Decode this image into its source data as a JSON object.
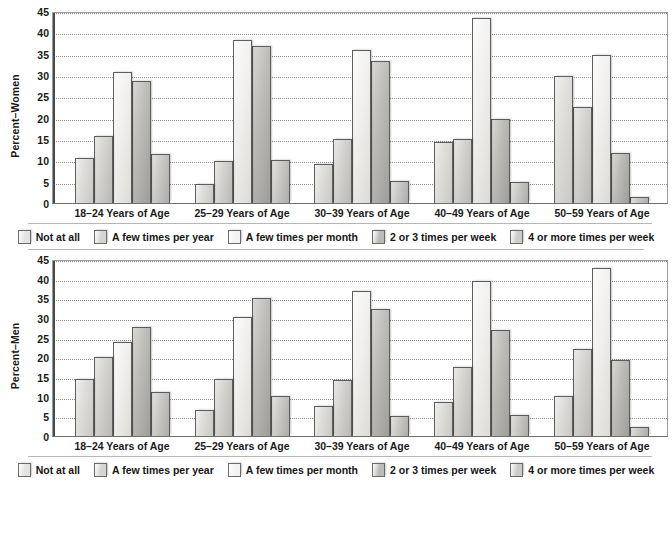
{
  "chart_data": [
    {
      "type": "bar",
      "title": "",
      "xlabel": "",
      "ylabel": "Percent–Women",
      "ylim": [
        0,
        45
      ],
      "yticks": [
        0,
        5,
        10,
        15,
        20,
        25,
        30,
        35,
        40,
        45
      ],
      "grid": true,
      "legend_position": "bottom",
      "categories": [
        "18–24 Years of Age",
        "25–29 Years of Age",
        "30–39 Years of Age",
        "40–49 Years of Age",
        "50–59 Years of Age"
      ],
      "series": [
        {
          "name": "Not at all",
          "values": [
            10.6,
            4.5,
            9.2,
            14.3,
            29.7
          ]
        },
        {
          "name": "A few times per year",
          "values": [
            15.7,
            9.9,
            15.1,
            15.0,
            22.5
          ]
        },
        {
          "name": "A few times per month",
          "values": [
            30.8,
            38.1,
            35.8,
            43.3,
            34.7
          ]
        },
        {
          "name": "2 or 3 times per week",
          "values": [
            28.7,
            36.7,
            33.2,
            19.6,
            11.7
          ]
        },
        {
          "name": "4 or more times per week",
          "values": [
            11.4,
            10.0,
            5.1,
            5.0,
            1.3
          ]
        }
      ]
    },
    {
      "type": "bar",
      "title": "",
      "xlabel": "",
      "ylabel": "Percent–Men",
      "ylim": [
        0,
        45
      ],
      "yticks": [
        0,
        5,
        10,
        15,
        20,
        25,
        30,
        35,
        40,
        45
      ],
      "grid": true,
      "legend_position": "bottom",
      "categories": [
        "18–24 Years of Age",
        "25–29 Years of Age",
        "30–39 Years of Age",
        "40–49 Years of Age",
        "50–59 Years of Age"
      ],
      "series": [
        {
          "name": "Not at all",
          "values": [
            14.5,
            6.7,
            7.6,
            8.7,
            10.2
          ]
        },
        {
          "name": "A few times per year",
          "values": [
            20.1,
            14.5,
            14.3,
            17.6,
            22.2
          ]
        },
        {
          "name": "A few times per month",
          "values": [
            24.0,
            30.2,
            36.8,
            39.5,
            42.8
          ]
        },
        {
          "name": "2 or 3 times per week",
          "values": [
            27.6,
            35.2,
            32.2,
            27.0,
            19.4
          ]
        },
        {
          "name": "4 or more times per week",
          "values": [
            11.2,
            10.1,
            5.2,
            5.3,
            2.4
          ]
        }
      ]
    }
  ],
  "panels": [
    {
      "id": "women",
      "ylabel": "Percent–Women",
      "yticks": [
        "45",
        "40",
        "35",
        "30",
        "25",
        "20",
        "15",
        "10",
        "5",
        "0"
      ],
      "categories": [
        "18–24 Years of Age",
        "25–29 Years of Age",
        "30–39 Years of Age",
        "40–49 Years of Age",
        "50–59 Years of Age"
      ]
    },
    {
      "id": "men",
      "ylabel": "Percent–Men",
      "yticks": [
        "45",
        "40",
        "35",
        "30",
        "25",
        "20",
        "15",
        "10",
        "5",
        "0"
      ],
      "categories": [
        "18–24 Years of Age",
        "25–29 Years of Age",
        "30–39 Years of Age",
        "40–49 Years of Age",
        "50–59 Years of Age"
      ]
    }
  ],
  "legend": {
    "items": [
      {
        "label": "Not at all",
        "color": "#e4e3e0"
      },
      {
        "label": "A few times per year",
        "color": "#d6d5d1"
      },
      {
        "label": "A few times per month",
        "color": "#f4f3f1"
      },
      {
        "label": "2 or 3 times per week",
        "color": "#bcbbb7"
      },
      {
        "label": "4 or more times per week",
        "color": "#cdccc8"
      }
    ]
  }
}
